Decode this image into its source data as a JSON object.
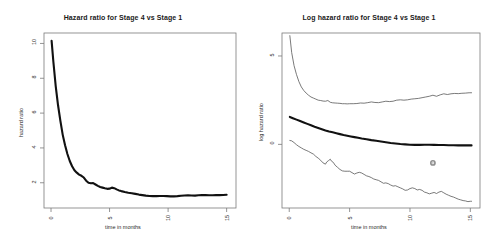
{
  "figure": {
    "background": "#ffffff",
    "line_color": "#111111",
    "frame_color": "#7a7a7a",
    "panels": 2
  },
  "chart_data": [
    {
      "type": "line",
      "panel": "left",
      "title": "Hazard ratio for Stage 4 vs Stage 1",
      "xlabel": "time in months",
      "ylabel": "hazard ratio",
      "xlim": [
        -0.6,
        15.8
      ],
      "ylim": [
        0.55,
        10.6
      ],
      "xticks": [
        0,
        5,
        10,
        15
      ],
      "xtick_labels": [
        "0",
        "5",
        "10",
        "15"
      ],
      "yticks": [
        2,
        4,
        6,
        8,
        10
      ],
      "ytick_labels": [
        "2",
        "4",
        "6",
        "8",
        "10"
      ],
      "grid": false,
      "legend": "none",
      "series": [
        {
          "name": "hazard ratio",
          "style": "thick-solid",
          "color": "#111111",
          "x": [
            0.05,
            0.2,
            0.4,
            0.6,
            0.8,
            1.0,
            1.2,
            1.4,
            1.6,
            1.8,
            2.0,
            2.2,
            2.4,
            2.6,
            2.8,
            3.0,
            3.2,
            3.4,
            3.6,
            3.8,
            4.0,
            4.2,
            4.4,
            4.6,
            4.8,
            5.0,
            5.2,
            5.4,
            5.6,
            5.8,
            6.0,
            6.3,
            6.6,
            6.9,
            7.2,
            7.5,
            7.8,
            8.1,
            8.4,
            8.7,
            9.0,
            9.3,
            9.6,
            9.9,
            10.2,
            10.5,
            10.8,
            11.1,
            11.4,
            11.7,
            12.0,
            12.3,
            12.6,
            12.9,
            13.2,
            13.5,
            13.8,
            14.1,
            14.4,
            14.7,
            15.0
          ],
          "y": [
            10.15,
            8.95,
            7.55,
            6.45,
            5.55,
            4.75,
            4.15,
            3.65,
            3.25,
            2.95,
            2.72,
            2.58,
            2.47,
            2.4,
            2.3,
            2.12,
            2.0,
            1.97,
            1.98,
            1.9,
            1.82,
            1.76,
            1.72,
            1.68,
            1.65,
            1.66,
            1.72,
            1.69,
            1.62,
            1.56,
            1.52,
            1.47,
            1.43,
            1.4,
            1.36,
            1.32,
            1.29,
            1.26,
            1.24,
            1.23,
            1.23,
            1.24,
            1.24,
            1.23,
            1.22,
            1.22,
            1.23,
            1.25,
            1.27,
            1.28,
            1.27,
            1.26,
            1.28,
            1.3,
            1.29,
            1.28,
            1.28,
            1.29,
            1.29,
            1.3,
            1.31
          ]
        }
      ]
    },
    {
      "type": "line",
      "panel": "right",
      "title": "Log hazard ratio for Stage 4 vs Stage 1",
      "xlabel": "time in months",
      "ylabel": "log hazard ratio",
      "xlim": [
        -0.6,
        15.8
      ],
      "ylim": [
        -3.6,
        6.3
      ],
      "xticks": [
        0,
        5,
        10,
        15
      ],
      "xtick_labels": [
        "0",
        "5",
        "10",
        "15"
      ],
      "yticks": [
        -5,
        0,
        5
      ],
      "ytick_labels": [
        "-5",
        "0",
        "5"
      ],
      "grid": false,
      "legend": "none",
      "annotations": [
        {
          "name": "outlier-point",
          "x": 11.9,
          "y": -1.05,
          "marker": "circle",
          "color": "#8e8e8e"
        }
      ],
      "series": [
        {
          "name": "upper confidence limit",
          "style": "thin-solid",
          "color": "#4d4d4d",
          "x": [
            0.05,
            0.2,
            0.4,
            0.6,
            0.8,
            1.0,
            1.2,
            1.4,
            1.6,
            1.8,
            2.0,
            2.2,
            2.4,
            2.6,
            2.8,
            3.0,
            3.2,
            3.4,
            3.6,
            3.8,
            4.0,
            4.2,
            4.4,
            4.6,
            4.8,
            5.0,
            5.3,
            5.6,
            5.9,
            6.2,
            6.5,
            6.8,
            7.1,
            7.4,
            7.7,
            8.0,
            8.3,
            8.6,
            8.9,
            9.2,
            9.5,
            9.8,
            10.1,
            10.4,
            10.7,
            11.0,
            11.3,
            11.6,
            11.9,
            12.2,
            12.5,
            12.8,
            13.1,
            13.4,
            13.7,
            14.0,
            14.3,
            14.6,
            14.9,
            15.1
          ],
          "y": [
            6.15,
            5.2,
            4.45,
            3.95,
            3.55,
            3.25,
            3.05,
            2.9,
            2.78,
            2.68,
            2.62,
            2.56,
            2.5,
            2.48,
            2.45,
            2.44,
            2.48,
            2.38,
            2.35,
            2.34,
            2.33,
            2.32,
            2.3,
            2.3,
            2.29,
            2.3,
            2.3,
            2.31,
            2.34,
            2.33,
            2.36,
            2.4,
            2.37,
            2.36,
            2.4,
            2.44,
            2.42,
            2.44,
            2.5,
            2.52,
            2.5,
            2.52,
            2.56,
            2.58,
            2.6,
            2.64,
            2.68,
            2.72,
            2.78,
            2.72,
            2.8,
            2.86,
            2.82,
            2.86,
            2.88,
            2.87,
            2.89,
            2.9,
            2.92,
            2.92
          ]
        },
        {
          "name": "log hazard ratio estimate",
          "style": "thick-solid",
          "color": "#111111",
          "x": [
            0.05,
            0.3,
            0.6,
            0.9,
            1.2,
            1.5,
            1.8,
            2.1,
            2.4,
            2.7,
            3.0,
            3.3,
            3.6,
            3.9,
            4.2,
            4.5,
            4.8,
            5.1,
            5.4,
            5.7,
            6.0,
            6.4,
            6.8,
            7.2,
            7.6,
            8.0,
            8.4,
            8.8,
            9.2,
            9.6,
            10.0,
            10.4,
            10.8,
            11.2,
            11.6,
            12.0,
            12.4,
            12.8,
            13.2,
            13.6,
            14.0,
            14.4,
            14.8,
            15.1
          ],
          "y": [
            1.55,
            1.48,
            1.4,
            1.32,
            1.24,
            1.16,
            1.08,
            1.0,
            0.93,
            0.86,
            0.79,
            0.73,
            0.68,
            0.63,
            0.58,
            0.53,
            0.49,
            0.45,
            0.41,
            0.37,
            0.33,
            0.29,
            0.24,
            0.2,
            0.16,
            0.12,
            0.08,
            0.05,
            0.02,
            0.0,
            -0.02,
            -0.03,
            -0.03,
            -0.02,
            -0.02,
            -0.03,
            -0.04,
            -0.04,
            -0.05,
            -0.05,
            -0.06,
            -0.06,
            -0.06,
            -0.06
          ]
        },
        {
          "name": "lower confidence limit",
          "style": "thin-solid",
          "color": "#4d4d4d",
          "x": [
            0.05,
            0.2,
            0.4,
            0.6,
            0.8,
            1.0,
            1.2,
            1.4,
            1.6,
            1.8,
            2.0,
            2.2,
            2.4,
            2.6,
            2.8,
            3.0,
            3.1,
            3.25,
            3.4,
            3.5,
            3.65,
            3.8,
            4.0,
            4.2,
            4.4,
            4.6,
            4.8,
            5.0,
            5.2,
            5.4,
            5.6,
            5.8,
            6.0,
            6.2,
            6.4,
            6.6,
            6.8,
            7.0,
            7.2,
            7.4,
            7.6,
            7.8,
            8.0,
            8.2,
            8.4,
            8.6,
            8.8,
            9.0,
            9.2,
            9.4,
            9.6,
            9.8,
            10.0,
            10.2,
            10.4,
            10.6,
            10.8,
            11.0,
            11.2,
            11.4,
            11.6,
            11.8,
            12.0,
            12.2,
            12.4,
            12.6,
            12.8,
            13.0,
            13.2,
            13.4,
            13.6,
            13.8,
            14.0,
            14.2,
            14.4,
            14.6,
            14.8,
            15.0,
            15.1
          ],
          "y": [
            0.22,
            0.2,
            0.1,
            -0.02,
            -0.12,
            -0.2,
            -0.28,
            -0.34,
            -0.4,
            -0.48,
            -0.55,
            -0.68,
            -0.78,
            -0.9,
            -1.05,
            -1.12,
            -1.0,
            -0.92,
            -0.84,
            -0.95,
            -1.02,
            -1.18,
            -1.3,
            -1.42,
            -1.5,
            -1.52,
            -1.52,
            -1.52,
            -1.6,
            -1.68,
            -1.62,
            -1.58,
            -1.62,
            -1.7,
            -1.78,
            -1.82,
            -1.88,
            -1.96,
            -2.0,
            -2.04,
            -2.12,
            -2.2,
            -2.18,
            -2.22,
            -2.3,
            -2.36,
            -2.34,
            -2.4,
            -2.46,
            -2.52,
            -2.6,
            -2.58,
            -2.5,
            -2.46,
            -2.5,
            -2.58,
            -2.55,
            -2.6,
            -2.7,
            -2.74,
            -2.8,
            -2.76,
            -2.72,
            -2.78,
            -2.7,
            -2.66,
            -2.74,
            -2.82,
            -2.88,
            -2.94,
            -2.98,
            -3.04,
            -3.1,
            -3.14,
            -3.18,
            -3.2,
            -3.24,
            -3.22,
            -3.22
          ]
        }
      ]
    }
  ]
}
